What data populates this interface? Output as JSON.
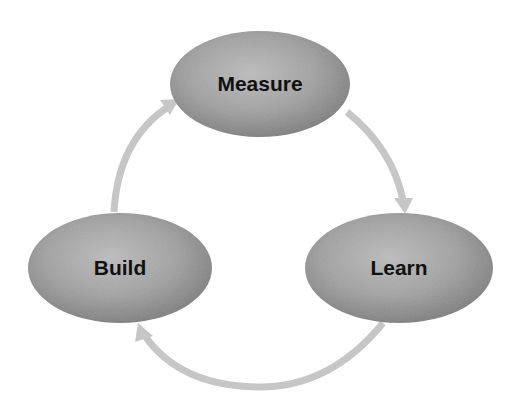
{
  "diagram": {
    "type": "cycle",
    "nodes": [
      {
        "id": "measure",
        "label": "Measure",
        "cx": 260,
        "cy": 84,
        "rx": 90,
        "ry": 53
      },
      {
        "id": "learn",
        "label": "Learn",
        "cx": 399,
        "cy": 268,
        "rx": 94,
        "ry": 55
      },
      {
        "id": "build",
        "label": "Build",
        "cx": 120,
        "cy": 268,
        "rx": 92,
        "ry": 55
      }
    ],
    "edges": [
      {
        "from": "measure",
        "to": "learn"
      },
      {
        "from": "learn",
        "to": "build"
      },
      {
        "from": "build",
        "to": "measure"
      }
    ],
    "colors": {
      "node_fill_light": "#bdbdbd",
      "node_fill_dark": "#7a7a7a",
      "arrow": "#c6c6c6",
      "label": "#111111",
      "background": "#ffffff"
    }
  }
}
